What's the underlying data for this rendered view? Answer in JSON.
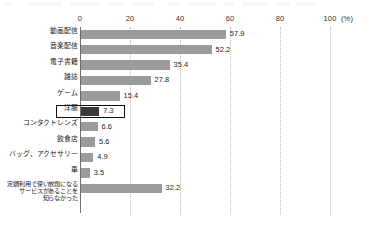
{
  "chart_data": {
    "type": "bar",
    "orientation": "horizontal",
    "title": "",
    "subtitle": "",
    "xlabel": "(%)",
    "ylabel": "",
    "xlim": [
      0,
      100
    ],
    "xticks": [
      0,
      20,
      40,
      60,
      80,
      100
    ],
    "xtick_labels": [
      "0",
      "20",
      "40",
      "60",
      "80",
      "100"
    ],
    "unit_label": "(%)",
    "grid": true,
    "grid_axis": "x",
    "grid_style": "dotted",
    "legend": false,
    "legend_position": "none",
    "categories": [
      "動画配信",
      "音楽配信",
      "電子書籍",
      "雑誌",
      "ゲーム",
      "洋服",
      "コンタクトレンズ",
      "飲食店",
      "バッグ、アクセサリー",
      "車",
      "定額利用で使い放題になる\nサービスがあることを\n知らなかった"
    ],
    "values": [
      57.9,
      52.2,
      35.4,
      27.8,
      15.4,
      7.3,
      6.6,
      5.6,
      4.9,
      3.5,
      32.2
    ],
    "value_labels": [
      "57.9",
      "52.2",
      "35.4",
      "27.8",
      "15.4",
      "7.3",
      "6.6",
      "5.6",
      "4.9",
      "3.5",
      "32.2"
    ],
    "highlighted_index": 5,
    "highlighted_category": "洋服",
    "colors": {
      "bar": "#9b9b9b",
      "bar_highlight": "#3a3a3a",
      "axis": "#6f6f6f",
      "gridline": "#b9b9b9",
      "text": "#1a1a1a",
      "background": "#ffffff"
    }
  }
}
